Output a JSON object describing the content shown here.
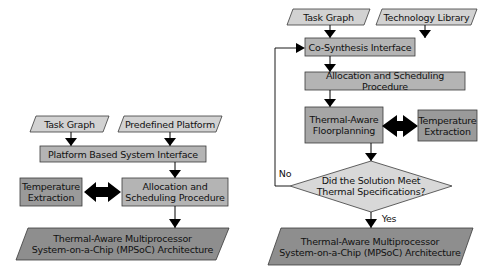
{
  "colors": {
    "input_fill": "#d2d2d2",
    "process_fill": "#b4b4b4",
    "temperature_fill": "#9a9a9a",
    "decision_fill": "#d8d8d8",
    "output_fill": "#8e8e8e",
    "stroke": "#3a3a3a",
    "arrow": "#000000"
  },
  "left_flow": {
    "inputs": [
      "Task Graph",
      "Predefined Platform"
    ],
    "interface": "Platform Based System Interface",
    "temperature": {
      "line1": "Temperature",
      "line2": "Extraction"
    },
    "allocation": {
      "line1": "Allocation and",
      "line2": "Scheduling Procedure"
    },
    "output": {
      "line1": "Thermal-Aware Multiprocessor",
      "line2": "System-on-a-Chip (MPSoC) Architecture"
    }
  },
  "right_flow": {
    "inputs": [
      "Task Graph",
      "Technology Library"
    ],
    "interface": "Co-Synthesis Interface",
    "allocation": "Allocation and Scheduling Procedure",
    "floorplanning": {
      "line1": "Thermal-Aware",
      "line2": "Floorplanning"
    },
    "temperature": {
      "line1": "Temperature",
      "line2": "Extraction"
    },
    "decision": {
      "line1": "Did the Solution Meet",
      "line2": "Thermal Specifications?"
    },
    "no_label": "No",
    "yes_label": "Yes",
    "output": {
      "line1": "Thermal-Aware Multiprocessor",
      "line2": "System-on-a-Chip (MPSoC) Architecture"
    }
  }
}
